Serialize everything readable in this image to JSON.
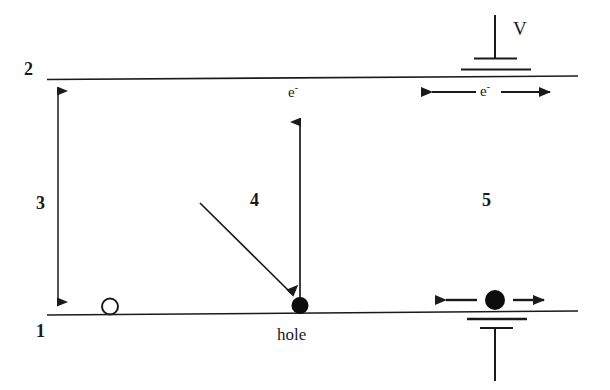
{
  "figure": {
    "background_color": "#ffffff",
    "ink_color": "#1a1a1a",
    "width": 610,
    "height": 390
  },
  "labels": {
    "level_top": "2",
    "level_bottom": "1",
    "gap_arrow": "3",
    "generation_region": "4",
    "drift_region": "5",
    "electron_top": "e",
    "electron_top_charge": "-",
    "electron_drift": "e",
    "electron_drift_charge": "-",
    "hole": "hole",
    "voltage": "V"
  },
  "elements": {
    "conduction_band": {
      "name": "conduction-band-line",
      "x1": 47,
      "y1": 79,
      "x2": 578,
      "y2": 76
    },
    "valence_band": {
      "name": "valence-band-line",
      "x1": 47,
      "y1": 315,
      "x2": 578,
      "y2": 311
    },
    "bandgap_arrow": {
      "name": "bandgap-double-arrow",
      "x": 58,
      "y_top": 80,
      "y_bottom": 313,
      "style": "double-headed-vertical"
    },
    "excitation_arrow": {
      "name": "electron-excitation-arrow",
      "x": 300,
      "y_tail": 303,
      "y_head": 112,
      "style": "single-headed-up"
    },
    "photon_arrow": {
      "name": "photon-absorption-arrow",
      "x1": 200,
      "y1": 203,
      "x2": 295,
      "y2": 297,
      "style": "single-headed-diagonal"
    },
    "hole_dot": {
      "name": "hole-particle-dot",
      "cx": 300,
      "cy": 306,
      "r": 8,
      "fill": "solid"
    },
    "open_circle": {
      "name": "empty-state-circle",
      "cx": 110,
      "cy": 307,
      "r": 8,
      "fill": "hollow"
    },
    "electron_dot": {
      "name": "electron-particle-dot",
      "cx": 495,
      "cy": 300,
      "r": 10,
      "fill": "solid"
    },
    "electron_drift_arrow": {
      "name": "electron-drift-double-arrow",
      "x_left": 434,
      "x_right": 556,
      "y": 300,
      "style": "double-headed-horizontal"
    },
    "conduction_drift_arrow": {
      "name": "conduction-drift-double-arrow",
      "x_left": 420,
      "x_right": 562,
      "y": 92,
      "style": "double-headed-horizontal-split-label"
    },
    "voltage_terminal_top": {
      "name": "voltage-source-top-terminal",
      "stem_x": 495,
      "stem_y_top": 15,
      "stem_y_bottom": 60,
      "bar_short": {
        "x1": 475,
        "x2": 516,
        "y": 58
      },
      "bar_long": {
        "x1": 462,
        "x2": 530,
        "y": 69
      }
    },
    "voltage_terminal_bottom": {
      "name": "voltage-source-bottom-terminal",
      "stem_x": 495,
      "stem_y_top": 328,
      "stem_y_bottom": 381,
      "bar_long": {
        "x1": 468,
        "x2": 526,
        "y": 319
      },
      "bar_short": {
        "x1": 480,
        "x2": 512,
        "y": 328
      }
    }
  }
}
